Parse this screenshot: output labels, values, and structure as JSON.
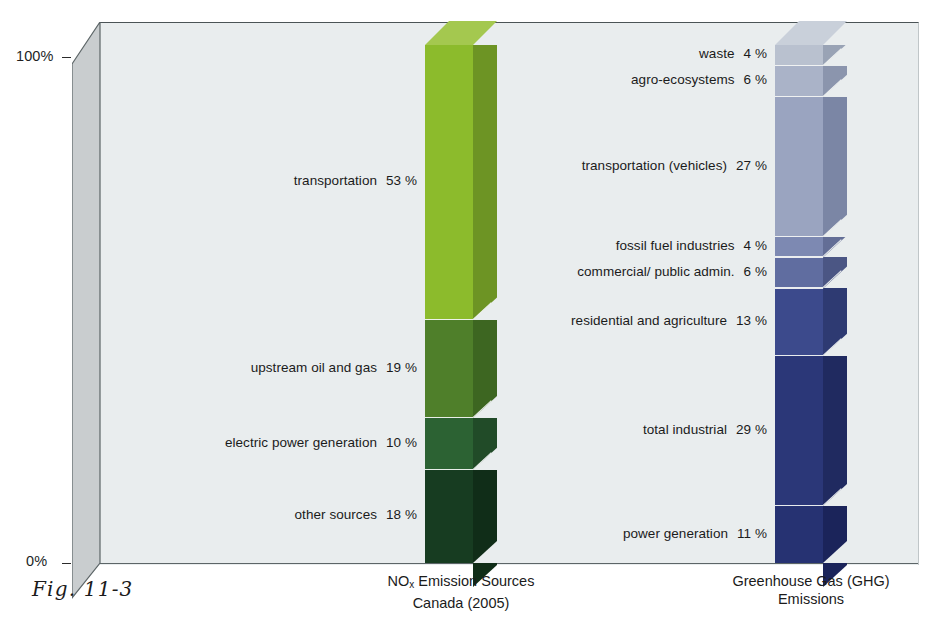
{
  "figure": {
    "number": "Fig. 11-3",
    "axis": {
      "top": "100%",
      "bottom": "0%"
    }
  },
  "chart_data": {
    "type": "bar",
    "title": "",
    "xlabel": "",
    "ylabel": "",
    "ylim": [
      0,
      100
    ],
    "grid": false,
    "legend": "inline-labels",
    "stacked": true,
    "categories": [
      "NOx Emission Sources Canada (2005)",
      "Greenhouse Gas (GHG) Emissions"
    ],
    "series": [
      {
        "name": "NOx Emission Sources Canada (2005)",
        "caption_line1": "NOx Emission Sources",
        "caption_line2": "Canada (2005)",
        "unit": "%",
        "segments": [
          {
            "label": "transportation",
            "value": 53,
            "value_text": "53 %",
            "front": "#8cbb2c",
            "side": "#6d9424",
            "top": "#a4c84f"
          },
          {
            "label": "upstream oil and gas",
            "value": 19,
            "value_text": "19 %",
            "front": "#4f7f2a",
            "side": "#3d6621",
            "top": "#5e8f33"
          },
          {
            "label": "electric power generation",
            "value": 10,
            "value_text": "10 %",
            "front": "#2c6233",
            "side": "#214b28",
            "top": "#35713c"
          },
          {
            "label": "other sources",
            "value": 18,
            "value_text": "18 %",
            "front": "#173c21",
            "side": "#102d18",
            "top": "#1d4a29"
          }
        ]
      },
      {
        "name": "Greenhouse Gas (GHG) Emissions",
        "caption_line1": "Greenhouse Gas (GHG)",
        "caption_line2": "Emissions",
        "unit": "%",
        "segments": [
          {
            "label": "waste",
            "value": 4,
            "value_text": "4 %",
            "front": "#b9c1cf",
            "side": "#99a3b5",
            "top": "#c9d0da"
          },
          {
            "label": "agro-ecosystems",
            "value": 6,
            "value_text": "6 %",
            "front": "#aab3c8",
            "side": "#8b95ad",
            "top": "#bcc3d4"
          },
          {
            "label": "transportation (vehicles)",
            "value": 27,
            "value_text": "27 %",
            "front": "#9aa4c0",
            "side": "#7b86a5",
            "top": "#adb5cb"
          },
          {
            "label": "fossil fuel industries",
            "value": 4,
            "value_text": "4 %",
            "front": "#7d89b2",
            "side": "#636e96",
            "top": "#909bc0"
          },
          {
            "label": "commercial/ public admin.",
            "value": 6,
            "value_text": "6 %",
            "front": "#606da0",
            "side": "#4b5684",
            "top": "#7380ae"
          },
          {
            "label": "residential and agriculture",
            "value": 13,
            "value_text": "13 %",
            "front": "#3c4a8c",
            "side": "#2e3a72",
            "top": "#4c5a9b"
          },
          {
            "label": "total industrial",
            "value": 29,
            "value_text": "29 %",
            "front": "#2b3778",
            "side": "#202a60",
            "top": "#394687"
          },
          {
            "label": "power generation",
            "value": 11,
            "value_text": "11 %",
            "front": "#263272",
            "side": "#1b245a",
            "top": "#333f82"
          }
        ]
      }
    ]
  },
  "colors": {
    "backwall": "#e9edee",
    "sidewall": "#c9cdcf",
    "page": "#ffffff",
    "text": "#1b1b1b"
  }
}
